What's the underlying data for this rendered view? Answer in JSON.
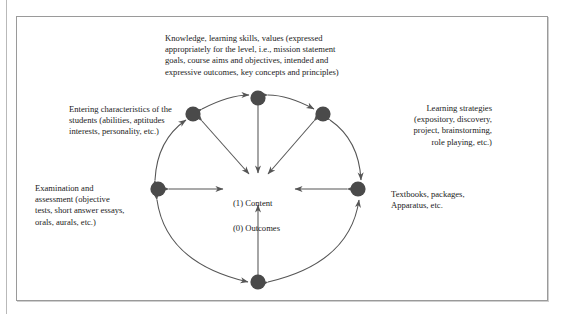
{
  "figure": {
    "center": {
      "line1": "(1) Content",
      "line2": "(0) Outcomes"
    },
    "nodes": [
      {
        "id": "knowledge",
        "label": "Knowledge, learning skills, values (expressed\nappropriately for the level, i.e., mission statement\ngoals, course aims and objectives, intended and\nexpressive outcomes, key concepts and principles)",
        "position": "top"
      },
      {
        "id": "entering-characteristics",
        "label": "Entering characteristics of the\nstudents (abilities, aptitudes\ninterests, personality, etc.)",
        "position": "upper-left"
      },
      {
        "id": "learning-strategies",
        "label": "Learning strategies\n(expository, discovery,\nproject, brainstorming,\nrole playing, etc.)",
        "position": "upper-right"
      },
      {
        "id": "examination-assessment",
        "label": "Examination and\nassessment (objective\ntests, short answer essays,\norals, aurals, etc.)",
        "position": "left"
      },
      {
        "id": "textbooks-packages",
        "label": "Textbooks, packages,\nApparatus, etc.",
        "position": "right"
      },
      {
        "id": "bottom-unlabeled",
        "label": "",
        "position": "bottom"
      }
    ],
    "colors": {
      "node_fill": "#4a4a4a",
      "arrow": "#555555",
      "frame_border": "#9a9a9a",
      "text": "#1b1b1b",
      "background": "#ffffff"
    }
  }
}
